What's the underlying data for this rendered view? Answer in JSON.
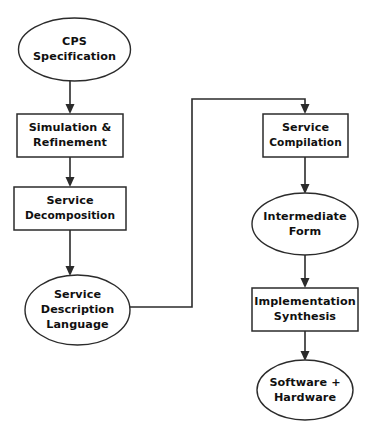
{
  "diagram": {
    "background_color": "#ffffff",
    "stroke_color": "#2b2b2b",
    "text_color": "#101010",
    "nodes": [
      {
        "id": "cps-specification",
        "shape": "ellipse",
        "lines": [
          "CPS",
          "Specification"
        ],
        "cx": 74.5,
        "cy": 49.5,
        "rx": 56,
        "ry": 31.5,
        "column": "left"
      },
      {
        "id": "simulation-refinement",
        "shape": "rectangle",
        "lines": [
          "Simulation &",
          "Refinement"
        ],
        "x": 17,
        "y": 114,
        "width": 106,
        "height": 43,
        "column": "left"
      },
      {
        "id": "service-decomposition",
        "shape": "rectangle",
        "lines": [
          "Service",
          "Decomposition"
        ],
        "x": 14,
        "y": 187,
        "width": 112,
        "height": 43,
        "column": "left"
      },
      {
        "id": "service-description-language",
        "shape": "ellipse",
        "lines": [
          "Service",
          "Description",
          "Language"
        ],
        "cx": 77.5,
        "cy": 310,
        "rx": 52.5,
        "ry": 35,
        "column": "left"
      },
      {
        "id": "service-compilation",
        "shape": "rectangle",
        "lines": [
          "Service",
          "Compilation"
        ],
        "x": 263,
        "y": 114,
        "width": 85,
        "height": 43,
        "column": "right"
      },
      {
        "id": "intermediate-form",
        "shape": "ellipse",
        "lines": [
          "Intermediate",
          "Form"
        ],
        "cx": 305,
        "cy": 224,
        "rx": 53,
        "ry": 31,
        "column": "right"
      },
      {
        "id": "implementation-synthesis",
        "shape": "rectangle",
        "lines": [
          "Implementation",
          "Synthesis"
        ],
        "x": 252,
        "y": 288,
        "width": 106,
        "height": 43,
        "column": "right"
      },
      {
        "id": "software-hardware",
        "shape": "ellipse",
        "lines": [
          "Software +",
          "Hardware"
        ],
        "cx": 305,
        "cy": 390,
        "rx": 48,
        "ry": 30,
        "column": "right"
      }
    ],
    "edges": [
      {
        "id": "cps-to-simulation",
        "from": "cps-specification",
        "to": "simulation-refinement",
        "type": "straight-vertical",
        "x": 70,
        "y1": 81,
        "y2": 112,
        "arrow": true
      },
      {
        "id": "simulation-to-decomposition",
        "from": "simulation-refinement",
        "to": "service-decomposition",
        "type": "straight-vertical",
        "x": 70,
        "y1": 157,
        "y2": 185,
        "arrow": true
      },
      {
        "id": "decomposition-to-sdl",
        "from": "service-decomposition",
        "to": "service-description-language",
        "type": "straight-vertical",
        "x": 70,
        "y1": 230,
        "y2": 273,
        "arrow": true
      },
      {
        "id": "sdl-to-compilation",
        "from": "service-description-language",
        "to": "service-compilation",
        "type": "elbow",
        "points": "130,307 192,307 192,99 305,99 305,112",
        "arrow": true
      },
      {
        "id": "compilation-to-intermediate",
        "from": "service-compilation",
        "to": "intermediate-form",
        "type": "straight-vertical",
        "x": 305,
        "y1": 157,
        "y2": 191,
        "arrow": true
      },
      {
        "id": "intermediate-to-implementation",
        "from": "intermediate-form",
        "to": "implementation-synthesis",
        "type": "straight-vertical",
        "x": 305,
        "y1": 255,
        "y2": 286,
        "arrow": true
      },
      {
        "id": "implementation-to-software-hardware",
        "from": "implementation-synthesis",
        "to": "software-hardware",
        "type": "straight-vertical",
        "x": 305,
        "y1": 331,
        "y2": 358,
        "arrow": true
      }
    ]
  }
}
